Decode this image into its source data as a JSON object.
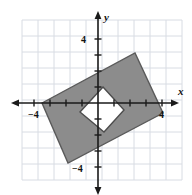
{
  "figure": {
    "axis_labels": {
      "x": "x",
      "y": "y"
    },
    "tick_labels": {
      "x_negative": "−4",
      "x_positive": "4",
      "y_positive": "4",
      "y_negative": "−4"
    },
    "colors": {
      "grid": "#d8dce3",
      "axis": "#1a1a1a",
      "shape_fill": "#8c8c8c",
      "shape_stroke": "#5a5a5a",
      "inner_fill": "#ffffff",
      "inner_stroke": "#4d4d4d",
      "background": "#ffffff",
      "text": "#111111"
    }
  },
  "chart_data": {
    "type": "scatter",
    "title": "",
    "xlabel": "x",
    "ylabel": "y",
    "xlim": [
      -4.75,
      5.25
    ],
    "ylim": [
      -5.2,
      5.2
    ],
    "grid": true,
    "grid_step": 1,
    "legend": null,
    "xticks": [
      -4,
      -3,
      -2,
      -1,
      1,
      2,
      3,
      4
    ],
    "yticks": [
      -4,
      -3,
      -2,
      -1,
      1,
      2,
      3,
      4
    ],
    "xtick_labels_shown": [
      {
        "value": -4,
        "label": "−4"
      },
      {
        "value": 4,
        "label": "4"
      }
    ],
    "ytick_labels_shown": [
      {
        "value": 4,
        "label": "4"
      },
      {
        "value": -4,
        "label": "−4"
      }
    ],
    "origin_px": {
      "x": 98,
      "y": 103
    },
    "unit_px": 16,
    "grid_extent_px": {
      "left": 22,
      "right": 182,
      "top": 20,
      "bottom": 180
    },
    "shapes": [
      {
        "name": "outer-rectangle",
        "kind": "polygon",
        "fill": "#8c8c8c",
        "stroke": "#5a5a5a",
        "vertices_data": [
          [
            -3.5,
            0.0
          ],
          [
            2.3,
            3.1
          ],
          [
            4.05,
            -0.65
          ],
          [
            -1.85,
            -3.75
          ]
        ],
        "vertices_px": [
          [
            42,
            103
          ],
          [
            135,
            53
          ],
          [
            163,
            113
          ],
          [
            68,
            163
          ]
        ]
      },
      {
        "name": "inner-quadrilateral",
        "kind": "polygon",
        "fill": "#ffffff",
        "stroke": "#4d4d4d",
        "vertices_data": [
          [
            0.3,
            1.0
          ],
          [
            1.63,
            -0.44
          ],
          [
            0.38,
            -1.81
          ],
          [
            -1.13,
            -0.56
          ]
        ],
        "vertices_px": [
          [
            103,
            87
          ],
          [
            124,
            110
          ],
          [
            104,
            132
          ],
          [
            80,
            112
          ]
        ]
      }
    ]
  }
}
